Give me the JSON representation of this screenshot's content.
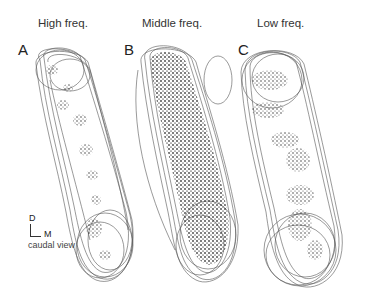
{
  "figure": {
    "columns": [
      {
        "letter": "A",
        "title": "High freq."
      },
      {
        "letter": "B",
        "title": "Middle freq."
      },
      {
        "letter": "C",
        "title": "Low freq."
      }
    ],
    "orientation": {
      "dorsal_label": "D",
      "medial_label": "M",
      "view_label": "caudal view"
    },
    "colors": {
      "outline": "#555555",
      "dots": "#222222",
      "background": "#ffffff"
    }
  }
}
